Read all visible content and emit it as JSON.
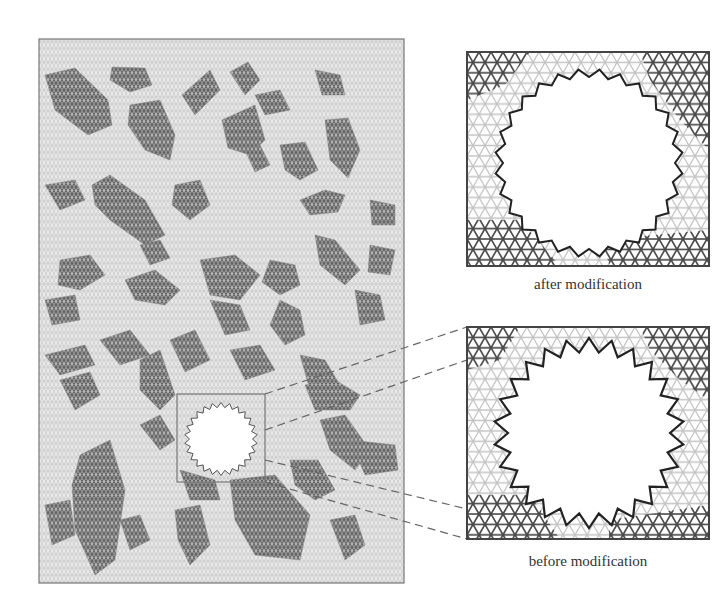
{
  "figure": {
    "captions": {
      "after": "after modification",
      "before": "before modification"
    },
    "colors": {
      "background": "#ffffff",
      "lattice_light": "#c4c4c4",
      "lattice_dark": "#555555",
      "cluster_fill": "#9a9a9a",
      "frame": "#777777",
      "hole_edge": "#333333",
      "dash": "#666666"
    },
    "main_panel": {
      "x": 39,
      "y": 39,
      "width": 365,
      "height": 544
    },
    "hole": {
      "cx": 221,
      "cy": 439,
      "r": 34
    },
    "zoom_box": {
      "x": 177,
      "y": 394,
      "width": 88,
      "height": 88
    },
    "detail_after": {
      "x": 467,
      "y": 52,
      "width": 242,
      "height": 214
    },
    "detail_before": {
      "x": 467,
      "y": 327,
      "width": 242,
      "height": 212
    },
    "clusters": [
      [
        [
          45,
          75
        ],
        [
          75,
          68
        ],
        [
          108,
          100
        ],
        [
          112,
          125
        ],
        [
          88,
          135
        ],
        [
          55,
          110
        ]
      ],
      [
        [
          112,
          67
        ],
        [
          145,
          68
        ],
        [
          152,
          85
        ],
        [
          130,
          92
        ],
        [
          110,
          80
        ]
      ],
      [
        [
          130,
          105
        ],
        [
          160,
          100
        ],
        [
          175,
          135
        ],
        [
          170,
          160
        ],
        [
          145,
          150
        ],
        [
          128,
          125
        ]
      ],
      [
        [
          182,
          95
        ],
        [
          210,
          70
        ],
        [
          220,
          90
        ],
        [
          195,
          115
        ]
      ],
      [
        [
          92,
          185
        ],
        [
          110,
          175
        ],
        [
          145,
          200
        ],
        [
          165,
          235
        ],
        [
          145,
          245
        ],
        [
          110,
          220
        ],
        [
          95,
          205
        ]
      ],
      [
        [
          175,
          185
        ],
        [
          200,
          180
        ],
        [
          210,
          205
        ],
        [
          190,
          220
        ],
        [
          172,
          205
        ]
      ],
      [
        [
          222,
          120
        ],
        [
          255,
          105
        ],
        [
          265,
          140
        ],
        [
          250,
          155
        ],
        [
          228,
          148
        ]
      ],
      [
        [
          230,
          72
        ],
        [
          248,
          62
        ],
        [
          260,
          80
        ],
        [
          245,
          95
        ]
      ],
      [
        [
          255,
          95
        ],
        [
          280,
          90
        ],
        [
          290,
          110
        ],
        [
          265,
          115
        ]
      ],
      [
        [
          315,
          70
        ],
        [
          340,
          75
        ],
        [
          345,
          95
        ],
        [
          322,
          95
        ]
      ],
      [
        [
          325,
          120
        ],
        [
          348,
          118
        ],
        [
          360,
          150
        ],
        [
          348,
          178
        ],
        [
          330,
          160
        ]
      ],
      [
        [
          280,
          145
        ],
        [
          305,
          142
        ],
        [
          318,
          170
        ],
        [
          300,
          180
        ],
        [
          285,
          170
        ]
      ],
      [
        [
          245,
          150
        ],
        [
          260,
          145
        ],
        [
          270,
          165
        ],
        [
          255,
          172
        ]
      ],
      [
        [
          300,
          200
        ],
        [
          325,
          190
        ],
        [
          345,
          195
        ],
        [
          338,
          212
        ],
        [
          310,
          215
        ]
      ],
      [
        [
          315,
          235
        ],
        [
          335,
          240
        ],
        [
          360,
          270
        ],
        [
          345,
          285
        ],
        [
          320,
          265
        ]
      ],
      [
        [
          270,
          260
        ],
        [
          295,
          265
        ],
        [
          300,
          285
        ],
        [
          280,
          295
        ],
        [
          262,
          282
        ]
      ],
      [
        [
          200,
          260
        ],
        [
          235,
          255
        ],
        [
          260,
          275
        ],
        [
          240,
          300
        ],
        [
          210,
          295
        ]
      ],
      [
        [
          140,
          245
        ],
        [
          160,
          240
        ],
        [
          170,
          258
        ],
        [
          150,
          265
        ]
      ],
      [
        [
          125,
          280
        ],
        [
          155,
          270
        ],
        [
          180,
          290
        ],
        [
          165,
          305
        ],
        [
          135,
          300
        ]
      ],
      [
        [
          60,
          260
        ],
        [
          90,
          255
        ],
        [
          105,
          275
        ],
        [
          80,
          290
        ],
        [
          58,
          285
        ]
      ],
      [
        [
          280,
          300
        ],
        [
          300,
          310
        ],
        [
          305,
          335
        ],
        [
          285,
          345
        ],
        [
          270,
          325
        ]
      ],
      [
        [
          210,
          300
        ],
        [
          240,
          305
        ],
        [
          250,
          330
        ],
        [
          225,
          335
        ]
      ],
      [
        [
          355,
          290
        ],
        [
          380,
          295
        ],
        [
          385,
          320
        ],
        [
          360,
          325
        ]
      ],
      [
        [
          370,
          200
        ],
        [
          395,
          205
        ],
        [
          395,
          225
        ],
        [
          372,
          225
        ]
      ],
      [
        [
          370,
          245
        ],
        [
          395,
          250
        ],
        [
          390,
          275
        ],
        [
          368,
          272
        ]
      ],
      [
        [
          45,
          185
        ],
        [
          75,
          180
        ],
        [
          85,
          200
        ],
        [
          60,
          210
        ]
      ],
      [
        [
          45,
          300
        ],
        [
          75,
          295
        ],
        [
          80,
          320
        ],
        [
          52,
          325
        ]
      ],
      [
        [
          100,
          340
        ],
        [
          130,
          330
        ],
        [
          150,
          355
        ],
        [
          120,
          365
        ]
      ],
      [
        [
          170,
          340
        ],
        [
          195,
          330
        ],
        [
          210,
          360
        ],
        [
          185,
          372
        ]
      ],
      [
        [
          230,
          350
        ],
        [
          260,
          345
        ],
        [
          275,
          370
        ],
        [
          245,
          380
        ]
      ],
      [
        [
          300,
          355
        ],
        [
          325,
          360
        ],
        [
          340,
          385
        ],
        [
          310,
          390
        ]
      ],
      [
        [
          140,
          360
        ],
        [
          160,
          350
        ],
        [
          175,
          395
        ],
        [
          160,
          410
        ],
        [
          140,
          390
        ]
      ],
      [
        [
          45,
          355
        ],
        [
          85,
          345
        ],
        [
          95,
          365
        ],
        [
          60,
          375
        ]
      ],
      [
        [
          60,
          380
        ],
        [
          90,
          372
        ],
        [
          100,
          395
        ],
        [
          75,
          410
        ]
      ],
      [
        [
          320,
          420
        ],
        [
          345,
          415
        ],
        [
          370,
          450
        ],
        [
          355,
          470
        ],
        [
          330,
          450
        ]
      ],
      [
        [
          305,
          385
        ],
        [
          335,
          380
        ],
        [
          360,
          395
        ],
        [
          350,
          410
        ],
        [
          315,
          410
        ]
      ],
      [
        [
          80,
          455
        ],
        [
          110,
          440
        ],
        [
          125,
          490
        ],
        [
          115,
          560
        ],
        [
          95,
          575
        ],
        [
          75,
          530
        ],
        [
          72,
          485
        ]
      ],
      [
        [
          140,
          425
        ],
        [
          160,
          415
        ],
        [
          175,
          440
        ],
        [
          160,
          450
        ]
      ],
      [
        [
          230,
          480
        ],
        [
          275,
          475
        ],
        [
          310,
          515
        ],
        [
          300,
          560
        ],
        [
          255,
          555
        ],
        [
          235,
          520
        ]
      ],
      [
        [
          180,
          470
        ],
        [
          215,
          480
        ],
        [
          220,
          500
        ],
        [
          190,
          500
        ]
      ],
      [
        [
          175,
          510
        ],
        [
          200,
          505
        ],
        [
          210,
          545
        ],
        [
          190,
          565
        ],
        [
          178,
          540
        ]
      ],
      [
        [
          290,
          460
        ],
        [
          318,
          460
        ],
        [
          335,
          490
        ],
        [
          315,
          500
        ],
        [
          295,
          485
        ]
      ],
      [
        [
          350,
          440
        ],
        [
          395,
          445
        ],
        [
          398,
          470
        ],
        [
          365,
          475
        ]
      ],
      [
        [
          330,
          520
        ],
        [
          355,
          515
        ],
        [
          365,
          545
        ],
        [
          345,
          560
        ]
      ],
      [
        [
          45,
          505
        ],
        [
          70,
          500
        ],
        [
          75,
          535
        ],
        [
          52,
          545
        ]
      ],
      [
        [
          120,
          520
        ],
        [
          140,
          515
        ],
        [
          150,
          540
        ],
        [
          130,
          550
        ]
      ]
    ]
  }
}
